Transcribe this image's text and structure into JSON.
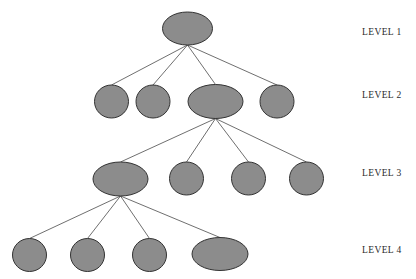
{
  "diagram": {
    "type": "hierarchy-tree",
    "title": "",
    "depth": 4,
    "node_fill": "#8c8c8c",
    "node_stroke": "#333333",
    "edge_color": "#4a4a4a",
    "background": "#ffffff",
    "label_color": "#2b2b2b"
  },
  "labels": [
    {
      "text": "LEVEL 1",
      "x": 362,
      "y": 33
    },
    {
      "text": "LEVEL 2",
      "x": 362,
      "y": 96
    },
    {
      "text": "LEVEL 3",
      "x": 362,
      "y": 174
    },
    {
      "text": "LEVEL 4",
      "x": 362,
      "y": 251
    }
  ],
  "nodes": [
    {
      "id": "n1",
      "level": 1,
      "cx": 187.5,
      "cy": 28.5,
      "rx": 25,
      "ry": 16.5,
      "shape": "wide-ellipse"
    },
    {
      "id": "n2a",
      "level": 2,
      "cx": 111.5,
      "cy": 101.5,
      "rx": 17,
      "ry": 16.5,
      "shape": "circle"
    },
    {
      "id": "n2b",
      "level": 2,
      "cx": 153,
      "cy": 101.5,
      "rx": 17,
      "ry": 16.5,
      "shape": "circle"
    },
    {
      "id": "n2c",
      "level": 2,
      "cx": 215.5,
      "cy": 101.5,
      "rx": 27.5,
      "ry": 17,
      "shape": "wide-ellipse"
    },
    {
      "id": "n2d",
      "level": 2,
      "cx": 277,
      "cy": 101.5,
      "rx": 17,
      "ry": 16.5,
      "shape": "circle"
    },
    {
      "id": "n3a",
      "level": 3,
      "cx": 120.5,
      "cy": 179,
      "rx": 27.5,
      "ry": 17,
      "shape": "wide-ellipse"
    },
    {
      "id": "n3b",
      "level": 3,
      "cx": 186.5,
      "cy": 178.5,
      "rx": 17,
      "ry": 16.5,
      "shape": "circle"
    },
    {
      "id": "n3c",
      "level": 3,
      "cx": 248.5,
      "cy": 178.5,
      "rx": 17,
      "ry": 16.5,
      "shape": "circle"
    },
    {
      "id": "n3d",
      "level": 3,
      "cx": 306.5,
      "cy": 178.5,
      "rx": 17,
      "ry": 16.5,
      "shape": "circle"
    },
    {
      "id": "n4a",
      "level": 4,
      "cx": 29.5,
      "cy": 255,
      "rx": 17,
      "ry": 16.5,
      "shape": "circle"
    },
    {
      "id": "n4b",
      "level": 4,
      "cx": 87.5,
      "cy": 255,
      "rx": 17,
      "ry": 16.5,
      "shape": "circle"
    },
    {
      "id": "n4c",
      "level": 4,
      "cx": 149.5,
      "cy": 255,
      "rx": 17,
      "ry": 16.5,
      "shape": "circle"
    },
    {
      "id": "n4d",
      "level": 4,
      "cx": 220,
      "cy": 254,
      "rx": 28,
      "ry": 16.5,
      "shape": "wide-ellipse"
    }
  ],
  "edges": [
    {
      "from": "n1",
      "to": "n2a",
      "x1": 187.5,
      "y1": 45,
      "x2": 111.5,
      "y2": 85
    },
    {
      "from": "n1",
      "to": "n2b",
      "x1": 187.5,
      "y1": 45,
      "x2": 153,
      "y2": 85
    },
    {
      "from": "n1",
      "to": "n2c",
      "x1": 187.5,
      "y1": 45,
      "x2": 215.5,
      "y2": 84.5
    },
    {
      "from": "n1",
      "to": "n2d",
      "x1": 187.5,
      "y1": 45,
      "x2": 277,
      "y2": 85
    },
    {
      "from": "n2c",
      "to": "n3a",
      "x1": 215.5,
      "y1": 118.5,
      "x2": 120.5,
      "y2": 162
    },
    {
      "from": "n2c",
      "to": "n3b",
      "x1": 215.5,
      "y1": 118.5,
      "x2": 186.5,
      "y2": 162
    },
    {
      "from": "n2c",
      "to": "n3c",
      "x1": 215.5,
      "y1": 118.5,
      "x2": 248.5,
      "y2": 162
    },
    {
      "from": "n2c",
      "to": "n3d",
      "x1": 215.5,
      "y1": 118.5,
      "x2": 306.5,
      "y2": 162
    },
    {
      "from": "n3a",
      "to": "n4a",
      "x1": 120.5,
      "y1": 196,
      "x2": 29.5,
      "y2": 238.5
    },
    {
      "from": "n3a",
      "to": "n4b",
      "x1": 120.5,
      "y1": 196,
      "x2": 87.5,
      "y2": 238.5
    },
    {
      "from": "n3a",
      "to": "n4c",
      "x1": 120.5,
      "y1": 196,
      "x2": 149.5,
      "y2": 238.5
    },
    {
      "from": "n3a",
      "to": "n4d",
      "x1": 120.5,
      "y1": 196,
      "x2": 220,
      "y2": 237.5
    }
  ]
}
